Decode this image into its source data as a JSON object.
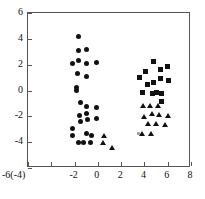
{
  "chart_data": {
    "type": "scatter",
    "title": "",
    "xlabel": "",
    "ylabel": "",
    "xlim": [
      -6,
      8
    ],
    "ylim": [
      -6,
      6
    ],
    "grid": false,
    "legend": "none",
    "x_ticks": [
      -6,
      -4,
      -2,
      0,
      2,
      4,
      6,
      8
    ],
    "x_tick_labels": [
      "-6(-4)",
      "",
      "-2",
      "0",
      "2",
      "4",
      "6",
      "8"
    ],
    "y_ticks": [
      6,
      4,
      2,
      0,
      -2,
      -4,
      -6
    ],
    "y_tick_labels": [
      "6",
      "4",
      "2",
      "0",
      "-2",
      "-4",
      "-6"
    ],
    "series": [
      {
        "name": "circles",
        "marker": "circle",
        "color": "#111111",
        "points": [
          [
            -1.65,
            4.2
          ],
          [
            -1.7,
            3.1
          ],
          [
            -0.95,
            3.2
          ],
          [
            -2.2,
            2.1
          ],
          [
            -1.7,
            2.35
          ],
          [
            -1.0,
            2.1
          ],
          [
            -0.1,
            2.15
          ],
          [
            -1.75,
            1.3
          ],
          [
            -1.0,
            1.1
          ],
          [
            -1.85,
            0.25
          ],
          [
            -1.85,
            0.0
          ],
          [
            -0.1,
            -1.3
          ],
          [
            -1.0,
            -1.25
          ],
          [
            -1.55,
            -1.9
          ],
          [
            -0.95,
            -1.8
          ],
          [
            -1.45,
            -2.4
          ],
          [
            -0.85,
            -2.25
          ],
          [
            -0.1,
            -2.2
          ],
          [
            -2.15,
            -3.45
          ],
          [
            -1.0,
            -3.3
          ],
          [
            -0.55,
            -3.45
          ],
          [
            -1.7,
            -4.0
          ],
          [
            -1.2,
            -4.05
          ],
          [
            -0.6,
            -4.0
          ],
          [
            -2.2,
            -2.95
          ],
          [
            -1.45,
            -0.95
          ]
        ]
      },
      {
        "name": "squares",
        "marker": "square",
        "color": "#111111",
        "points": [
          [
            4.8,
            2.25
          ],
          [
            4.05,
            1.5
          ],
          [
            5.4,
            1.6
          ],
          [
            6.0,
            1.85
          ],
          [
            3.6,
            1.0
          ],
          [
            4.75,
            0.65
          ],
          [
            5.4,
            0.9
          ],
          [
            6.05,
            0.75
          ],
          [
            3.85,
            -0.15
          ],
          [
            4.7,
            -0.2
          ],
          [
            5.5,
            -0.2
          ],
          [
            5.5,
            -0.85
          ],
          [
            4.3,
            0.45
          ],
          [
            5.05,
            -0.15
          ]
        ]
      },
      {
        "name": "triangles",
        "marker": "triangle",
        "color": "#111111",
        "points": [
          [
            3.9,
            -1.2
          ],
          [
            4.5,
            -1.2
          ],
          [
            5.15,
            -1.2
          ],
          [
            3.95,
            -2.05
          ],
          [
            4.65,
            -1.85
          ],
          [
            5.3,
            -1.9
          ],
          [
            6.0,
            -1.95
          ],
          [
            4.35,
            -2.6
          ],
          [
            5.05,
            -2.6
          ],
          [
            5.75,
            -2.65
          ],
          [
            3.85,
            -3.35
          ],
          [
            4.55,
            -3.35
          ],
          [
            0.55,
            -3.5
          ],
          [
            0.45,
            -4.1
          ],
          [
            1.2,
            -4.45
          ]
        ]
      },
      {
        "name": "small-marker",
        "marker": "dot-small",
        "color": "#9a9a9a",
        "points": [
          [
            3.5,
            -3.35
          ]
        ]
      }
    ]
  }
}
